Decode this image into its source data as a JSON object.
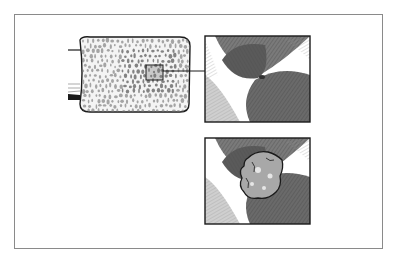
{
  "figure": {
    "colors": {
      "background": "#ffffff",
      "frame": "#8a8a8a",
      "ink": "#1a1a1a",
      "bone_fill": "#f4f4f4",
      "pore": "#6e6e6e",
      "muscle_dark": "#5a5a5a",
      "muscle_mid": "#8c8c8c",
      "muscle_light": "#c8c8c8",
      "lesion": "#a8a8a8",
      "lesion_highlight": "#e6e6e6"
    },
    "panels": [
      {
        "name": "bone-cross-section",
        "content": "trabecular bone with highlighted region"
      },
      {
        "name": "magnified-normal",
        "content": "magnified view of highlighted region"
      },
      {
        "name": "magnified-lesion",
        "content": "magnified view showing growth/lesion"
      }
    ]
  }
}
